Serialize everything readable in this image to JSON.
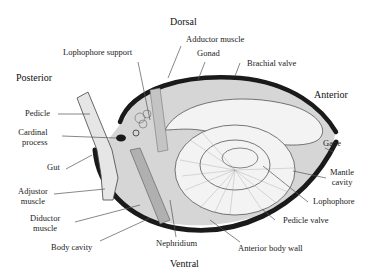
{
  "diagram": {
    "type": "anatomical-cross-section",
    "orientation": {
      "top": "Dorsal",
      "bottom": "Ventral",
      "left": "Posterior",
      "right": "Anterior"
    },
    "labels": {
      "lophophore_support": "Lophophore support",
      "adductor_muscle": "Adductor muscle",
      "gonad": "Gonad",
      "brachial_valve": "Brachial valve",
      "pedicle": "Pedicle",
      "cardinal_process": "Cardinal process",
      "cardinal_process_line1": "Cardinal",
      "cardinal_process_line2": "process",
      "gut": "Gut",
      "adjustor_muscle_line1": "Adjustor",
      "adjustor_muscle_line2": "muscle",
      "diductor_muscle_line1": "Diductor",
      "diductor_muscle_line2": "muscle",
      "body_cavity": "Body cavity",
      "nephridium": "Nephridium",
      "anterior_body_wall": "Anterior body wall",
      "pedicle_valve": "Pedicle valve",
      "lophophore": "Lophophore",
      "mantle_cavity_line1": "Mantle",
      "mantle_cavity_line2": "cavity",
      "gape": "Gape"
    },
    "colors": {
      "shell": "#1a1a1a",
      "mantle_fill": "#d4d4d4",
      "lophophore_fill": "#f2f2f2",
      "leader_line": "#555555",
      "text": "#222222"
    }
  }
}
